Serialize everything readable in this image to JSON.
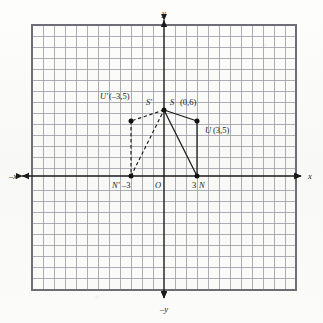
{
  "figure": {
    "background_color": "#fbfbfa",
    "grid_color": "#9a9aa2",
    "grid_border_color": "#6e6e76",
    "axis_color": "#1a1a1a",
    "segment_color": "#1a1a1a",
    "point_color": "#111111"
  },
  "axes": {
    "x_positive_label": "x",
    "x_negative_label": "–x",
    "y_positive_label": "y",
    "y_negative_label": "–y",
    "origin_label": "O"
  },
  "grid": {
    "left": 32,
    "top": 25,
    "right": 296,
    "bottom": 290,
    "cell_size": 11,
    "columns": 24,
    "rows": 24,
    "origin_x": 164,
    "origin_y": 176
  },
  "points": [
    {
      "id": "S",
      "label": "S",
      "coord_text": "(0,6)",
      "x": 0,
      "y": 6,
      "label_position": "right",
      "marker": true
    },
    {
      "id": "S-prime",
      "label": "S'",
      "coord_text": "",
      "x": 0,
      "y": 6,
      "label_position": "left",
      "marker": false
    },
    {
      "id": "U",
      "label": "U",
      "coord_text": "(3,5)",
      "x": 3,
      "y": 5,
      "label_position": "below-right",
      "marker": true
    },
    {
      "id": "U-prime",
      "label": "U'",
      "coord_text": "(–3,5)",
      "x": -3,
      "y": 5,
      "label_position": "above-left",
      "marker": true
    },
    {
      "id": "N",
      "label": "N",
      "coord_text": "3",
      "x": 3,
      "y": 0,
      "label_position": "below",
      "marker": true
    },
    {
      "id": "N-prime",
      "label": "N'",
      "coord_text": "–3",
      "x": -3,
      "y": 0,
      "label_position": "below",
      "marker": true
    }
  ],
  "segments": [
    {
      "id": "S-to-U",
      "from": "S",
      "to": "U",
      "style": "solid"
    },
    {
      "id": "U-to-N",
      "from": "U",
      "to": "N",
      "style": "solid"
    },
    {
      "id": "N-to-S",
      "from": "N",
      "to": "S",
      "style": "solid"
    },
    {
      "id": "S-to-U-prime",
      "from": "S-prime",
      "to": "U-prime",
      "style": "dashed"
    },
    {
      "id": "U-prime-to-N-prime",
      "from": "U-prime",
      "to": "N-prime",
      "style": "dashed"
    },
    {
      "id": "N-prime-to-S",
      "from": "N-prime",
      "to": "S-prime",
      "style": "dashed"
    }
  ],
  "labels": {
    "s_label": "S'",
    "s_point_label": "S",
    "s_coord": "(0,6)",
    "u_prime_label": "U'",
    "u_prime_coord": "(–3,5)",
    "u_label": "U",
    "u_coord": "(3,5)",
    "n_prime_label": "N'",
    "n_prime_value": "–3",
    "n_value": "3",
    "n_label": "N",
    "origin": "O",
    "y_axis": "y",
    "neg_y_axis": "–y",
    "x_axis": "x",
    "neg_x_axis": "–x"
  }
}
